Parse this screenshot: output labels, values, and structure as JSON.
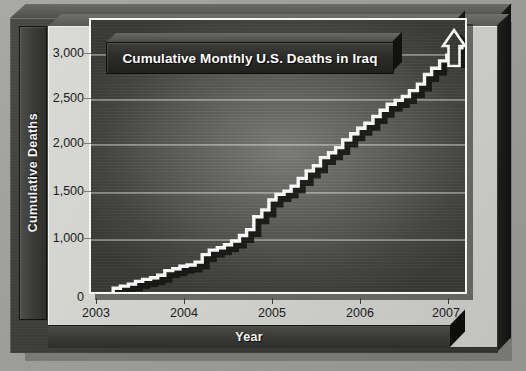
{
  "chart_data": {
    "type": "line",
    "title": "Cumulative Monthly U.S. Deaths in Iraq",
    "xlabel": "Year",
    "ylabel": "Cumulative Deaths",
    "style": "step",
    "grid": true,
    "legend": null,
    "annotations": [
      "up-arrow at end of series"
    ],
    "xlim": [
      2003.0,
      2007.25
    ],
    "ylim": [
      0,
      3150
    ],
    "xticks": [
      "2003",
      "2004",
      "2005",
      "2006",
      "2007"
    ],
    "xtick_values": [
      2003,
      2004,
      2005,
      2006,
      2007
    ],
    "yticks": [
      "0",
      "1,000",
      "1,500",
      "2,000",
      "2,500",
      "3,000"
    ],
    "ytick_values": [
      0,
      1000,
      1500,
      2000,
      2500,
      3000
    ],
    "x": [
      2003.25,
      2003.33,
      2003.42,
      2003.5,
      2003.58,
      2003.67,
      2003.75,
      2003.83,
      2003.92,
      2004.0,
      2004.08,
      2004.17,
      2004.25,
      2004.33,
      2004.42,
      2004.5,
      2004.58,
      2004.67,
      2004.75,
      2004.83,
      2004.92,
      2005.0,
      2005.08,
      2005.17,
      2005.25,
      2005.33,
      2005.42,
      2005.5,
      2005.58,
      2005.67,
      2005.75,
      2005.83,
      2005.92,
      2006.0,
      2006.08,
      2006.17,
      2006.25,
      2006.33,
      2006.42,
      2006.5,
      2006.58,
      2006.67,
      2006.75,
      2006.83,
      2006.92,
      2007.0,
      2007.08,
      2007.17
    ],
    "values": [
      139,
      176,
      213,
      261,
      296,
      327,
      371,
      453,
      486,
      533,
      553,
      605,
      740,
      820,
      862,
      916,
      982,
      1048,
      1111,
      1248,
      1320,
      1427,
      1485,
      1520,
      1572,
      1652,
      1730,
      1784,
      1869,
      1919,
      1973,
      2057,
      2125,
      2186,
      2241,
      2317,
      2385,
      2453,
      2496,
      2539,
      2604,
      2677,
      2783,
      2853,
      2935,
      2999,
      3080,
      3150
    ],
    "series_label": "Cumulative Deaths"
  },
  "chart": {
    "title": "Cumulative Monthly U.S. Deaths in Iraq",
    "y_axis_title": "Cumulative Deaths",
    "x_axis_title": "Year",
    "y_labels": [
      "3,000",
      "2,500",
      "2,000",
      "1,500",
      "1,000",
      "0"
    ],
    "x_labels": [
      "2003",
      "2004",
      "2005",
      "2006",
      "2007"
    ]
  },
  "colors": {
    "paper": "#9d9d9a",
    "frame": "#3c3c3a",
    "board": "#cfcfcc",
    "plot_center": "#7e7e7a",
    "plot_edge": "#3b3b38",
    "line": "#ffffff",
    "line_shadow": "#141412",
    "gridline": "#e8e8e4",
    "text_dark": "#1b1b1a",
    "text_light": "#ffffff"
  }
}
